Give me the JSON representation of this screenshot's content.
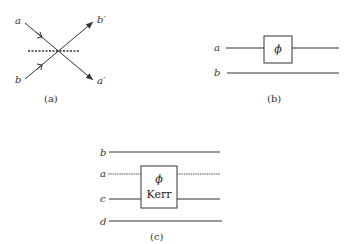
{
  "panels": {
    "a": {
      "caption": "(a)",
      "inputs": [
        "a",
        "b"
      ],
      "outputs": [
        "b′",
        "a′"
      ],
      "element": "beam-splitter (dotted line)"
    },
    "b": {
      "caption": "(b)",
      "modes": [
        "a",
        "b"
      ],
      "box_label": "ϕ"
    },
    "c": {
      "caption": "(c)",
      "modes": [
        "b",
        "a",
        "c",
        "d"
      ],
      "box_label_top": "ϕ",
      "box_label_bottom": "Kerr"
    }
  },
  "colors": {
    "line": "#333333",
    "background": "#ffffff"
  }
}
